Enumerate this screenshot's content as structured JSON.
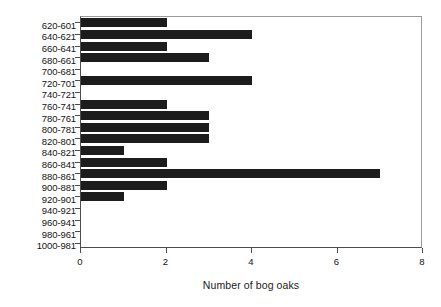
{
  "chart_data": {
    "type": "bar",
    "orientation": "horizontal",
    "title": "",
    "xlabel": "Number of bog oaks",
    "ylabel": "Years BC",
    "xlim": [
      0,
      8
    ],
    "xticks": [
      0,
      2,
      4,
      6,
      8
    ],
    "xtick_labels": [
      "0",
      "2",
      "4",
      "6",
      "8"
    ],
    "grid": false,
    "legend": null,
    "bar_color": "#1c1c1c",
    "categories": [
      "620-601",
      "640-621",
      "660-641",
      "680-661",
      "700-681",
      "720-701",
      "740-721",
      "760-741",
      "780-761",
      "800-781",
      "820-801",
      "840-821",
      "860-841",
      "880-861",
      "900-881",
      "920-901",
      "940-921",
      "960-941",
      "980-961",
      "1000-981"
    ],
    "values": [
      2,
      4,
      2,
      3,
      0,
      4,
      0,
      2,
      3,
      3,
      3,
      1,
      2,
      7,
      2,
      1,
      0,
      0,
      0,
      0
    ]
  }
}
